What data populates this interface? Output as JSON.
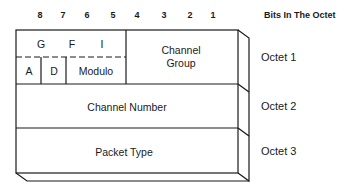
{
  "header": {
    "bit_numbers": [
      "8",
      "7",
      "6",
      "5",
      "4",
      "3",
      "2",
      "1"
    ],
    "bits_title": "Bits In The Octet"
  },
  "octets": [
    {
      "label": "Octet 1",
      "fields": {
        "gfi_g": "G",
        "gfi_f": "F",
        "gfi_i": "I",
        "a": "A",
        "d": "D",
        "modulo": "Modulo",
        "channel_group_line1": "Channel",
        "channel_group_line2": "Group"
      }
    },
    {
      "label": "Octet 2",
      "field": "Channel Number"
    },
    {
      "label": "Octet 3",
      "field": "Packet Type"
    }
  ],
  "colors": {
    "line": "#1a1a1a",
    "background": "#ffffff"
  }
}
